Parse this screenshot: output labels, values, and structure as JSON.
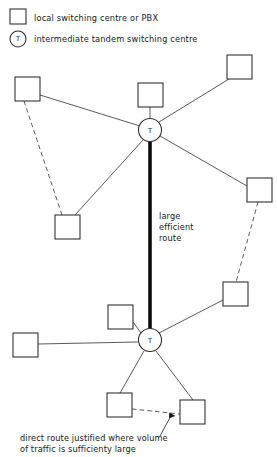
{
  "legend": {
    "items": [
      {
        "symbol": "square",
        "label": "local switching centre or PBX"
      },
      {
        "symbol": "circle-t",
        "label": "intermediate tandem switching centre",
        "glyph": "T"
      }
    ]
  },
  "annotations": {
    "trunk_label_lines": [
      "large",
      "efficient",
      "route"
    ],
    "caption_lines": [
      "direct route justified where volume",
      "of traffic is sufficienty large"
    ]
  },
  "nodes": {
    "tandem": [
      {
        "id": "tandem-upper",
        "glyph": "T",
        "cx": 150,
        "cy": 130,
        "r": 11.5
      },
      {
        "id": "tandem-lower",
        "glyph": "T",
        "cx": 150,
        "cy": 340,
        "r": 11.5
      }
    ],
    "local": [
      {
        "id": "local-top-left",
        "x": 15,
        "y": 77,
        "w": 25,
        "h": 24
      },
      {
        "id": "local-top-centre",
        "x": 138,
        "y": 83,
        "w": 25,
        "h": 24
      },
      {
        "id": "local-top-right",
        "x": 227,
        "y": 55,
        "w": 25,
        "h": 24
      },
      {
        "id": "local-mid-left",
        "x": 55,
        "y": 215,
        "w": 25,
        "h": 24
      },
      {
        "id": "local-mid-right",
        "x": 247,
        "y": 178,
        "w": 25,
        "h": 24
      },
      {
        "id": "local-right-lower",
        "x": 223,
        "y": 282,
        "w": 25,
        "h": 24
      },
      {
        "id": "local-above-lower-t",
        "x": 108,
        "y": 305,
        "w": 25,
        "h": 24
      },
      {
        "id": "local-left-lower",
        "x": 13,
        "y": 333,
        "w": 25,
        "h": 24
      },
      {
        "id": "local-bottom-left",
        "x": 107,
        "y": 393,
        "w": 25,
        "h": 24
      },
      {
        "id": "local-bottom-right",
        "x": 180,
        "y": 400,
        "w": 25,
        "h": 24
      }
    ]
  },
  "links": {
    "trunk": {
      "from": "tandem-upper",
      "to": "tandem-lower",
      "style": "thick",
      "x": 150,
      "y1": 141,
      "y2": 329
    },
    "solid": [
      {
        "from": "local-top-left",
        "to": "tandem-upper",
        "x1": 40,
        "y1": 95,
        "x2": 140,
        "y2": 126
      },
      {
        "from": "local-top-centre",
        "to": "tandem-upper",
        "x1": 150,
        "y1": 107,
        "x2": 150,
        "y2": 118
      },
      {
        "from": "local-top-right",
        "to": "tandem-upper",
        "x1": 229,
        "y1": 79,
        "x2": 159,
        "y2": 122
      },
      {
        "from": "local-mid-left",
        "to": "tandem-upper",
        "x1": 75,
        "y1": 215,
        "x2": 143,
        "y2": 140
      },
      {
        "from": "local-mid-right",
        "to": "tandem-upper",
        "x1": 247,
        "y1": 186,
        "x2": 160,
        "y2": 136
      },
      {
        "from": "local-right-lower",
        "to": "tandem-lower",
        "x1": 223,
        "y1": 300,
        "x2": 159,
        "y2": 333
      },
      {
        "from": "local-above-lower-t",
        "to": "tandem-lower",
        "x1": 133,
        "y1": 322,
        "x2": 141,
        "y2": 333
      },
      {
        "from": "local-left-lower",
        "to": "tandem-lower",
        "x1": 38,
        "y1": 344,
        "x2": 138,
        "y2": 342
      },
      {
        "from": "local-bottom-left",
        "to": "tandem-lower",
        "x1": 120,
        "y1": 393,
        "x2": 144,
        "y2": 351
      },
      {
        "from": "local-bottom-right",
        "to": "tandem-lower",
        "x1": 193,
        "y1": 400,
        "x2": 156,
        "y2": 351
      }
    ],
    "dashed": [
      {
        "from": "local-top-left",
        "to": "local-mid-left",
        "x1": 24,
        "y1": 101,
        "x2": 62,
        "y2": 215
      },
      {
        "from": "local-mid-right",
        "to": "local-right-lower",
        "x1": 258,
        "y1": 202,
        "x2": 236,
        "y2": 282
      },
      {
        "from": "local-bottom-left",
        "to": "local-bottom-right",
        "x1": 132,
        "y1": 409,
        "x2": 180,
        "y2": 414
      }
    ]
  },
  "pointer": {
    "x1": 160,
    "y1": 435,
    "x2": 172,
    "y2": 412
  }
}
